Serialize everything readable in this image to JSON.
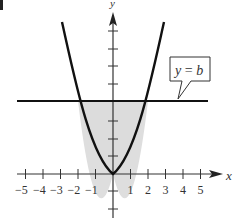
{
  "figure": {
    "corner_mark": ")",
    "axes": {
      "x_label": "x",
      "y_label": "y",
      "x_ticks": [
        -5,
        -4,
        -3,
        -2,
        -1,
        1,
        2,
        3,
        4,
        5
      ],
      "x_tick_labels": [
        "−5",
        "−4",
        "−3",
        "−2",
        "−1",
        "1",
        "2",
        "3",
        "4",
        "5"
      ]
    },
    "curves": [
      {
        "name": "parabola",
        "equation": "y = (b/4) x²",
        "vertex": [
          0,
          0
        ]
      },
      {
        "name": "horizontal line",
        "equation": "y = b"
      }
    ],
    "callout_label": "y = b",
    "callout_parts": {
      "lhs": "y",
      "eq": " = ",
      "rhs": "b"
    },
    "shaded_region": "region between parabola and line y = b, for -2 ≤ x ≤ 2",
    "colors": {
      "stroke": "#111111",
      "shade": "#dedede",
      "axis": "#333333"
    }
  }
}
